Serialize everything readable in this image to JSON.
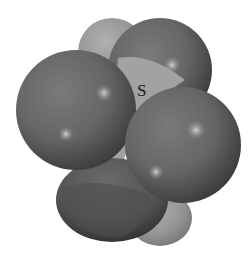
{
  "diagram": {
    "type": "space-filling molecular model",
    "central_atom": {
      "label": "S",
      "color": "#9e9e9e"
    },
    "colors": {
      "background": "#ffffff",
      "outer_atom": "#6a6a6a",
      "outer_atom_dark": "#3e3e3e",
      "outer_atom_highlight": "#b8b8b8",
      "central_atom_light": "#a8a8a8",
      "central_atom_dark": "#7e7e7e"
    }
  }
}
